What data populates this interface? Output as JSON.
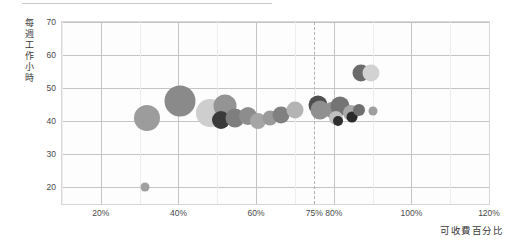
{
  "chart_data": {
    "type": "scatter",
    "title": "",
    "subtitle": "",
    "xlabel": "可收費百分比",
    "ylabel": "每週工作小時",
    "ylabel_chars": [
      "每",
      "週",
      "工",
      "作",
      "小",
      "時"
    ],
    "xlim": [
      10,
      120
    ],
    "ylim": [
      15,
      70
    ],
    "x_ticks": [
      "20%",
      "40%",
      "60%",
      "75%",
      "80%",
      "100%",
      "120%"
    ],
    "x_tick_values": [
      20,
      40,
      60,
      75,
      80,
      100,
      120
    ],
    "y_ticks": [
      "70",
      "60",
      "50",
      "40",
      "30",
      "20"
    ],
    "y_tick_values": [
      70,
      60,
      50,
      40,
      30,
      20
    ],
    "grid": true,
    "legend": "none",
    "annotations": [
      {
        "name": "target-billable-line",
        "type": "vertical-dashed-line",
        "x": 75,
        "label": "75%",
        "color": "#b0b0b0"
      }
    ],
    "bubble_size_unit": "px-diameter",
    "series": [
      {
        "name": "employees",
        "points": [
          {
            "id": "p01",
            "x": 31.5,
            "y": 20.0,
            "size": 9,
            "color": "#a0a0a0"
          },
          {
            "id": "p02",
            "x": 32.0,
            "y": 41.0,
            "size": 26,
            "color": "#9c9c9c"
          },
          {
            "id": "p03",
            "x": 40.5,
            "y": 46.0,
            "size": 31,
            "color": "#8a8a8a"
          },
          {
            "id": "p04",
            "x": 48.0,
            "y": 42.5,
            "size": 28,
            "color": "#cecece"
          },
          {
            "id": "p05",
            "x": 52.0,
            "y": 44.5,
            "size": 23,
            "color": "#949494"
          },
          {
            "id": "p06",
            "x": 51.0,
            "y": 40.5,
            "size": 18,
            "color": "#3a3a3a"
          },
          {
            "id": "p07",
            "x": 54.5,
            "y": 41.0,
            "size": 19,
            "color": "#7e7e7e"
          },
          {
            "id": "p08",
            "x": 58.0,
            "y": 41.5,
            "size": 18,
            "color": "#8d8d8d"
          },
          {
            "id": "p09",
            "x": 60.5,
            "y": 40.0,
            "size": 16,
            "color": "#a5a5a5"
          },
          {
            "id": "p10",
            "x": 63.5,
            "y": 41.0,
            "size": 15,
            "color": "#9a9a9a"
          },
          {
            "id": "p11",
            "x": 66.5,
            "y": 42.0,
            "size": 17,
            "color": "#808080"
          },
          {
            "id": "p12",
            "x": 70.0,
            "y": 43.5,
            "size": 17,
            "color": "#b4b4b4"
          },
          {
            "id": "p13",
            "x": 76.0,
            "y": 45.0,
            "size": 19,
            "color": "#4f4f4f"
          },
          {
            "id": "p14",
            "x": 76.5,
            "y": 43.5,
            "size": 19,
            "color": "#8f8f8f"
          },
          {
            "id": "p15",
            "x": 79.5,
            "y": 43.5,
            "size": 16,
            "color": "#909090"
          },
          {
            "id": "p16",
            "x": 81.5,
            "y": 44.5,
            "size": 19,
            "color": "#747474"
          },
          {
            "id": "p17",
            "x": 80.5,
            "y": 41.0,
            "size": 14,
            "color": "#c0c0c0"
          },
          {
            "id": "p18",
            "x": 81.0,
            "y": 40.0,
            "size": 10,
            "color": "#2e2e2e"
          },
          {
            "id": "p19",
            "x": 84.5,
            "y": 42.5,
            "size": 16,
            "color": "#a8a8a8"
          },
          {
            "id": "p20",
            "x": 84.8,
            "y": 41.3,
            "size": 11,
            "color": "#2b2b2b"
          },
          {
            "id": "p21",
            "x": 86.5,
            "y": 43.5,
            "size": 12,
            "color": "#6e6e6e"
          },
          {
            "id": "p22",
            "x": 90.0,
            "y": 43.0,
            "size": 9,
            "color": "#9e9e9e"
          },
          {
            "id": "p23",
            "x": 87.0,
            "y": 54.5,
            "size": 17,
            "color": "#6b6b6b"
          },
          {
            "id": "p24",
            "x": 89.5,
            "y": 54.5,
            "size": 17,
            "color": "#d2d2d2"
          }
        ]
      }
    ]
  },
  "axis": {
    "y_title": "每週工作小時",
    "x_title": "可收費百分比"
  }
}
